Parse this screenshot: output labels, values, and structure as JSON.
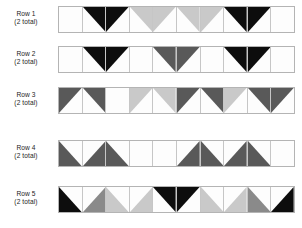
{
  "diagram": {
    "palette": {
      "black": "#0d0d0d",
      "dark_gray": "#595959",
      "mid_gray": "#8a8a8a",
      "light_gray": "#c9c9c9",
      "white": "#fdfdfd",
      "grid_line": "#b4b4b4",
      "text": "#1c1c1c"
    },
    "cells_per_row": 10,
    "rows": [
      {
        "label": "Row 1",
        "total": "(2 total)",
        "cells": [
          {
            "shape": "square",
            "fill": "white"
          },
          {
            "shape": "triangle-tr",
            "fill": "black"
          },
          {
            "shape": "triangle-tl",
            "fill": "black"
          },
          {
            "shape": "triangle-tr",
            "fill": "light_gray"
          },
          {
            "shape": "triangle-tl",
            "fill": "light_gray"
          },
          {
            "shape": "triangle-tr",
            "fill": "light_gray"
          },
          {
            "shape": "triangle-tl",
            "fill": "light_gray"
          },
          {
            "shape": "triangle-tr",
            "fill": "black"
          },
          {
            "shape": "triangle-tl",
            "fill": "black"
          },
          {
            "shape": "square",
            "fill": "white"
          }
        ]
      },
      {
        "label": "Row 2",
        "total": "(2 total)",
        "cells": [
          {
            "shape": "square",
            "fill": "white"
          },
          {
            "shape": "triangle-tr",
            "fill": "black"
          },
          {
            "shape": "triangle-tl",
            "fill": "black"
          },
          {
            "shape": "square",
            "fill": "white"
          },
          {
            "shape": "triangle-tr",
            "fill": "dark_gray"
          },
          {
            "shape": "triangle-tl",
            "fill": "dark_gray"
          },
          {
            "shape": "square",
            "fill": "white"
          },
          {
            "shape": "triangle-tr",
            "fill": "black"
          },
          {
            "shape": "triangle-tl",
            "fill": "black"
          },
          {
            "shape": "square",
            "fill": "white"
          }
        ]
      },
      {
        "label": "Row 3",
        "total": "(2 total)",
        "cells": [
          {
            "shape": "triangle-tl",
            "fill": "dark_gray"
          },
          {
            "shape": "triangle-tr",
            "fill": "dark_gray"
          },
          {
            "shape": "square",
            "fill": "white"
          },
          {
            "shape": "triangle-tl",
            "fill": "light_gray"
          },
          {
            "shape": "triangle-tr",
            "fill": "light_gray"
          },
          {
            "shape": "triangle-tl",
            "fill": "dark_gray"
          },
          {
            "shape": "triangle-tr",
            "fill": "dark_gray"
          },
          {
            "shape": "triangle-tl",
            "fill": "light_gray"
          },
          {
            "shape": "triangle-tr",
            "fill": "dark_gray"
          },
          {
            "shape": "triangle-tl",
            "fill": "dark_gray"
          }
        ]
      },
      {
        "label": "Row 4",
        "total": "(2 total)",
        "cells": [
          {
            "shape": "triangle-bl",
            "fill": "dark_gray"
          },
          {
            "shape": "triangle-br",
            "fill": "dark_gray"
          },
          {
            "shape": "triangle-bl",
            "fill": "dark_gray"
          },
          {
            "shape": "square",
            "fill": "white"
          },
          {
            "shape": "square",
            "fill": "white"
          },
          {
            "shape": "triangle-br",
            "fill": "dark_gray"
          },
          {
            "shape": "triangle-bl",
            "fill": "dark_gray"
          },
          {
            "shape": "triangle-br",
            "fill": "dark_gray"
          },
          {
            "shape": "triangle-bl",
            "fill": "dark_gray"
          },
          {
            "shape": "square",
            "fill": "white"
          }
        ]
      },
      {
        "label": "Row 5",
        "total": "(2 total)",
        "cells": [
          {
            "shape": "triangle-bl",
            "fill": "black"
          },
          {
            "shape": "triangle-br",
            "fill": "mid_gray"
          },
          {
            "shape": "triangle-bl",
            "fill": "light_gray"
          },
          {
            "shape": "triangle-br",
            "fill": "light_gray"
          },
          {
            "shape": "triangle-tr",
            "fill": "black"
          },
          {
            "shape": "triangle-tl",
            "fill": "black"
          },
          {
            "shape": "triangle-bl",
            "fill": "light_gray"
          },
          {
            "shape": "triangle-br",
            "fill": "light_gray"
          },
          {
            "shape": "triangle-bl",
            "fill": "mid_gray"
          },
          {
            "shape": "triangle-br",
            "fill": "black"
          }
        ]
      }
    ]
  }
}
